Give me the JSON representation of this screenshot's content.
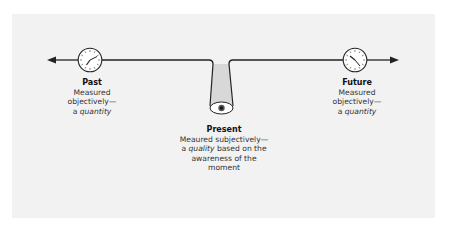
{
  "diagram": {
    "past": {
      "title": "Past",
      "line1": "Measured",
      "line2": "objectively—",
      "line3_prefix": "a ",
      "line3_em": "quantity",
      "icon": "clock-icon"
    },
    "present": {
      "title": "Present",
      "line1": "Meaured subjectively—",
      "line2_prefix": "a ",
      "line2_em": "quality",
      "line2_suffix": " based on the",
      "line3": "awareness of the",
      "line4": "moment",
      "icon": "eye-icon"
    },
    "future": {
      "title": "Future",
      "line1": "Measured",
      "line2": "objectively—",
      "line3_prefix": "a ",
      "line3_em": "quantity",
      "icon": "clock-icon"
    },
    "colors": {
      "panel": "#f2f2f2",
      "line": "#222222",
      "funnel_fill": "#d6d6d6"
    }
  }
}
